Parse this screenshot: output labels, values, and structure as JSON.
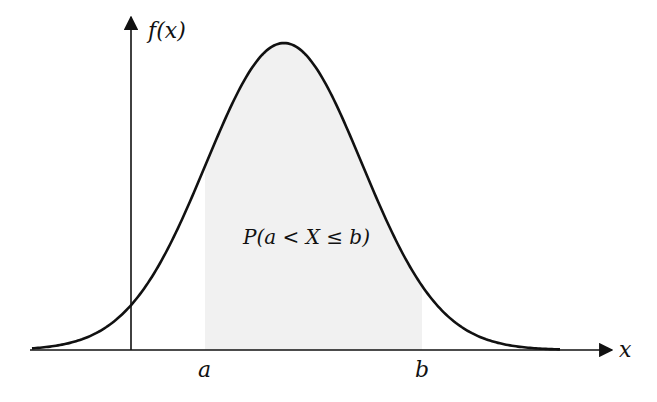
{
  "figure": {
    "y_axis_label": "f(x)",
    "x_axis_label": "x",
    "tick_labels": {
      "a": "a",
      "b": "b"
    },
    "region_label": "P(a < X ≤ b)",
    "colors": {
      "curve": "#111111",
      "axis": "#111111",
      "shade": "#f1f1f1",
      "background": "#ffffff"
    }
  },
  "chart_data": {
    "type": "area",
    "title": "",
    "xlabel": "x",
    "ylabel": "f(x)",
    "curve": "normal density (bell curve)",
    "shaded_interval": {
      "from": "a",
      "to": "b"
    },
    "annotations": [
      "P(a < X ≤ b)"
    ],
    "x_ticks": [
      "a",
      "b"
    ],
    "grid": false,
    "legend": null,
    "pixel_geometry": {
      "x_axis_y": 350,
      "x_axis_from": 30,
      "x_axis_to": 613,
      "y_axis_x": 131,
      "y_axis_top": 15,
      "peak_x": 284,
      "peak_y": 43,
      "sigma_px": 78,
      "a_x": 205,
      "b_x": 422
    }
  }
}
